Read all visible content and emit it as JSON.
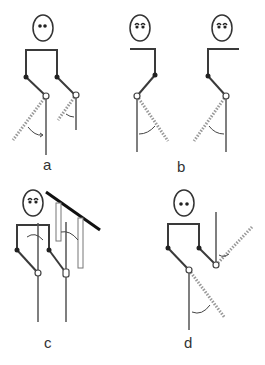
{
  "figure": {
    "panels": [
      {
        "id": "a",
        "label": "a",
        "description": "Stick figure with two legs; both lower legs show rotation range from vertical to dotted position"
      },
      {
        "id": "b",
        "label": "b",
        "description": "Two half-figures facing opposite directions, each with single leg showing rotation to dotted position"
      },
      {
        "id": "c",
        "label": "c",
        "description": "Stick figure with legs as vertical poles, hanging rectangular pendulums from a diagonal bar"
      },
      {
        "id": "d",
        "label": "d",
        "description": "Stick figure with one leg pointing down and one pointing up, each with dotted rotated positions"
      }
    ],
    "colors": {
      "line": "#3a3a3a",
      "dotted": "#999999",
      "background": "#ffffff"
    }
  }
}
